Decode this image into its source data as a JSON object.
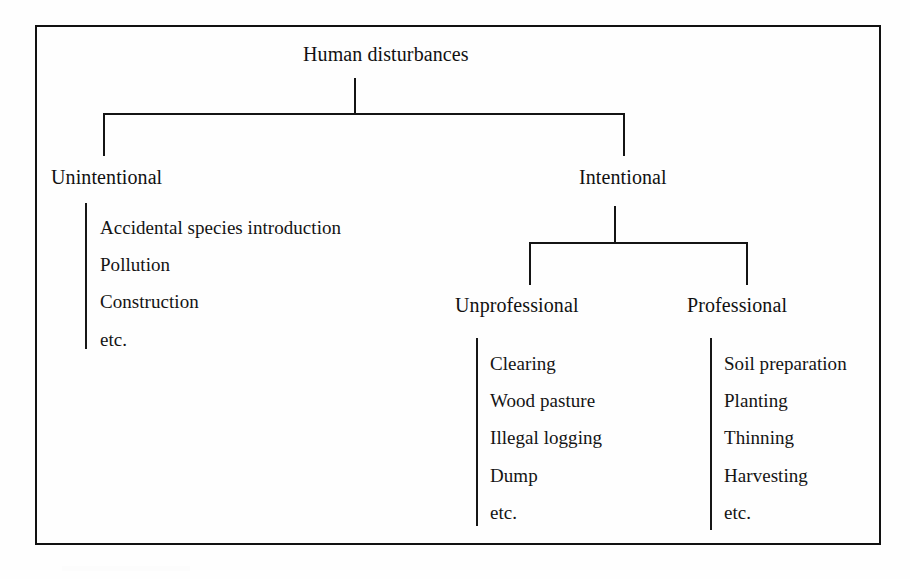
{
  "figure": {
    "kind": "hierarchy-tree-diagram",
    "border_color": "#111111",
    "line_color": "#141414",
    "text_color": "#111111",
    "background_color": "#ffffff"
  },
  "tree": {
    "root": {
      "label": "Human disturbances"
    },
    "level2": {
      "left": {
        "label": "Unintentional"
      },
      "right": {
        "label": "Intentional"
      }
    },
    "level3": {
      "left": {
        "label": "Unprofessional"
      },
      "right": {
        "label": "Professional"
      }
    },
    "leaves": {
      "unintentional": [
        "Accidental species introduction",
        "Pollution",
        "Construction",
        "etc."
      ],
      "unprofessional": [
        "Clearing",
        "Wood pasture",
        "Illegal logging",
        "Dump",
        "etc."
      ],
      "professional": [
        "Soil preparation",
        "Planting",
        "Thinning",
        "Harvesting",
        "etc."
      ]
    }
  }
}
